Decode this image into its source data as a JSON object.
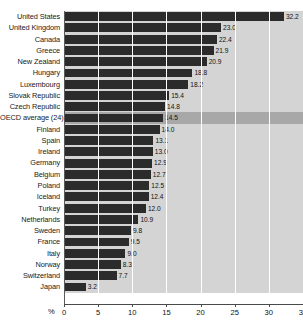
{
  "chart_data": {
    "type": "bar",
    "orientation": "horizontal",
    "title": "",
    "xlabel": "%",
    "ylabel": "",
    "xlim": [
      0,
      35
    ],
    "xticks": [
      0,
      5,
      10,
      15,
      20,
      25,
      30,
      35
    ],
    "xtick_labels": [
      "0",
      "5",
      "10",
      "15",
      "20",
      "25",
      "30",
      "35"
    ],
    "grid": true,
    "legend": null,
    "categories": [
      "United States",
      "United Kingdom",
      "Canada",
      "Greece",
      "New Zealand",
      "Hungary",
      "Luxembourg",
      "Slovak Republic",
      "Czech Republic",
      "OECD average (24)",
      "Finland",
      "Spain",
      "Ireland",
      "Germany",
      "Belgium",
      "Poland",
      "Iceland",
      "Turkey",
      "Netherlands",
      "Sweden",
      "France",
      "Italy",
      "Norway",
      "Switzerland",
      "Japan"
    ],
    "values": [
      32.2,
      23.0,
      22.4,
      21.9,
      20.9,
      18.8,
      18.2,
      15.4,
      14.8,
      14.5,
      14.0,
      13.1,
      13.0,
      12.9,
      12.7,
      12.5,
      12.4,
      12.0,
      10.9,
      9.8,
      9.5,
      9.0,
      8.3,
      7.7,
      3.2
    ],
    "value_labels": [
      "32.2",
      "23.0",
      "22.4",
      "21.9",
      "20.9",
      "18.8",
      "18.2",
      "15.4",
      "14.8",
      "14.5",
      "14.0",
      "13.1",
      "13.0",
      "12.9",
      "12.7",
      "12.5",
      "12.4",
      "12.0",
      "10.9",
      "9.8",
      "9.5",
      "9.0",
      "8.3",
      "7.7",
      "3.2"
    ],
    "highlight_category": "OECD average (24)",
    "colors": {
      "bar": "#2b2b2b",
      "plot_background": "#d4d4d4",
      "highlight_background": "#a8a8a8",
      "gridline": "#ffffff",
      "axis": "#4a4a4a",
      "text": "#111111"
    }
  }
}
